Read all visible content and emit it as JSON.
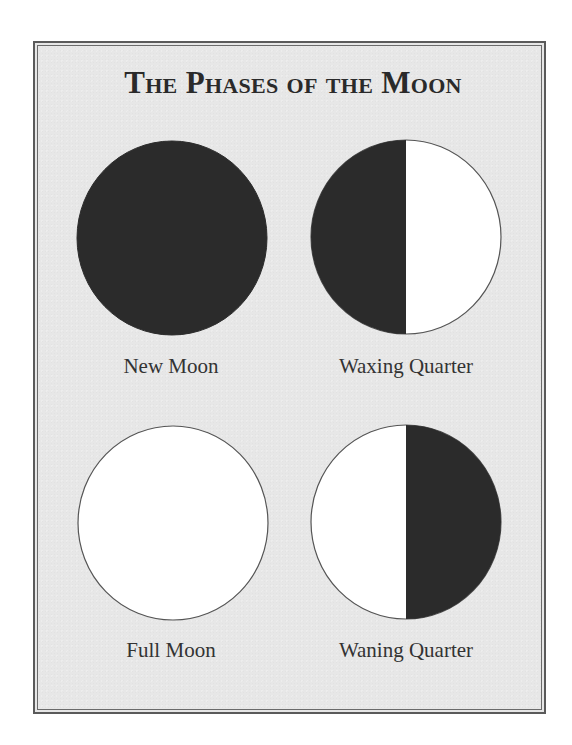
{
  "title": "The Phases of the Moon",
  "colors": {
    "dark": "#2b2b2b",
    "light": "#ffffff",
    "outline": "#555555",
    "background": "#e7e7e7",
    "frame": "#5a5a5a"
  },
  "phases": [
    {
      "label": "New Moon",
      "shading": "full-dark",
      "icon": "new-moon-icon"
    },
    {
      "label": "Waxing Quarter",
      "shading": "left-dark-half",
      "icon": "waxing-quarter-icon"
    },
    {
      "label": "Full Moon",
      "shading": "full-light",
      "icon": "full-moon-icon"
    },
    {
      "label": "Waning Quarter",
      "shading": "right-dark-half",
      "icon": "waning-quarter-icon"
    }
  ]
}
